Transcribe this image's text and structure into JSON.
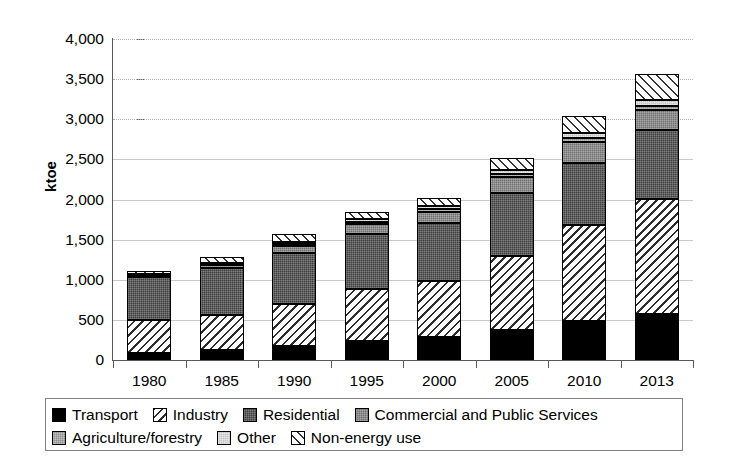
{
  "chart_data": {
    "type": "bar",
    "stacked": true,
    "title": "",
    "xlabel": "",
    "ylabel": "ktoe",
    "ylim": [
      0,
      4000
    ],
    "ytick_labels": [
      "4,000",
      "3,500",
      "3,000",
      "2,500",
      "2,000",
      "1,500",
      "1,000",
      "500",
      "0"
    ],
    "ytick_values": [
      4000,
      3500,
      3000,
      2500,
      2000,
      1500,
      1000,
      500,
      0
    ],
    "grid": true,
    "legend_position": "bottom",
    "categories": [
      "1980",
      "1985",
      "1990",
      "1995",
      "2000",
      "2005",
      "2010",
      "2013"
    ],
    "series": [
      {
        "name": "Transport",
        "pattern": "solid-black",
        "values": [
          90,
          125,
          170,
          240,
          290,
          375,
          490,
          570
        ]
      },
      {
        "name": "Industry",
        "pattern": "diagonal-hatch",
        "values": [
          410,
          435,
          525,
          640,
          700,
          915,
          1190,
          1440
        ]
      },
      {
        "name": "Residential",
        "pattern": "dark-gray-dotted",
        "values": [
          540,
          590,
          640,
          690,
          720,
          790,
          780,
          855
        ]
      },
      {
        "name": "Commercial and Public Services",
        "pattern": "mid-gray-dotted",
        "values": [
          15,
          35,
          80,
          120,
          135,
          195,
          255,
          245
        ]
      },
      {
        "name": "Agriculture/forestry",
        "pattern": "gray-dotted",
        "values": [
          10,
          15,
          25,
          35,
          35,
          45,
          55,
          60
        ]
      },
      {
        "name": "Other",
        "pattern": "light-gray-dotted",
        "values": [
          10,
          15,
          25,
          35,
          40,
          50,
          60,
          65
        ]
      },
      {
        "name": "Non-energy use",
        "pattern": "cross-diamond",
        "values": [
          30,
          65,
          100,
          90,
          95,
          145,
          215,
          335
        ]
      }
    ],
    "totals": [
      1105,
      1280,
      1565,
      1850,
      2015,
      2515,
      3045,
      3570
    ]
  },
  "legend": {
    "items": [
      {
        "label": "Transport"
      },
      {
        "label": "Industry"
      },
      {
        "label": "Residential"
      },
      {
        "label": "Commercial and Public Services"
      },
      {
        "label": "Agriculture/forestry"
      },
      {
        "label": "Other"
      },
      {
        "label": "Non-energy use"
      }
    ]
  }
}
